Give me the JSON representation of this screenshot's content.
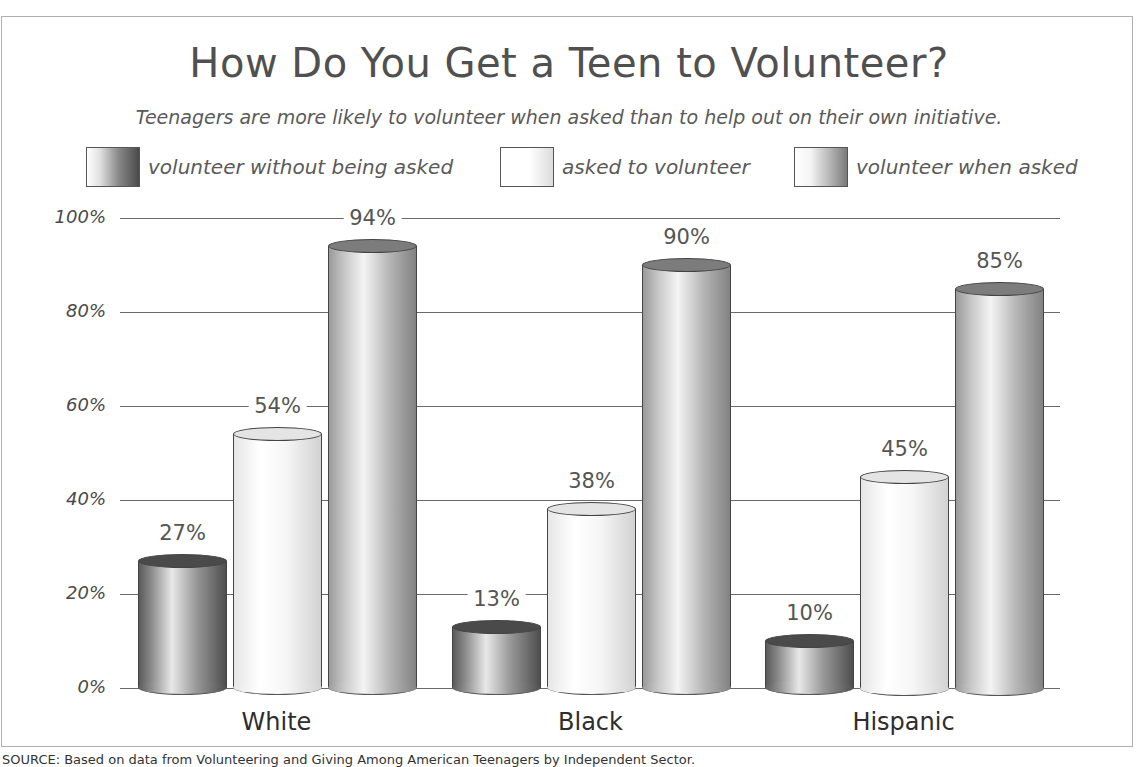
{
  "chart_data": {
    "type": "bar",
    "title": "How Do You Get a Teen to Volunteer?",
    "subtitle": "Teenagers are more likely to volunteer when asked than to help out on their own initiative.",
    "categories": [
      "White",
      "Black",
      "Hispanic"
    ],
    "series": [
      {
        "name": "volunteer without being asked",
        "values": [
          27,
          13,
          10
        ],
        "labels": [
          "27%",
          "13%",
          "10%"
        ],
        "color": "#4a4a4a"
      },
      {
        "name": "asked to volunteer",
        "values": [
          54,
          38,
          45
        ],
        "labels": [
          "54%",
          "38%",
          "45%"
        ],
        "color": "#e8e8e8"
      },
      {
        "name": "volunteer when asked",
        "values": [
          94,
          90,
          85
        ],
        "labels": [
          "94%",
          "90%",
          "85%"
        ],
        "color": "#9a9a9a"
      }
    ],
    "xlabel": "",
    "ylabel": "",
    "ylim": [
      0,
      100
    ],
    "yticks": [
      "0%",
      "20%",
      "40%",
      "60%",
      "80%",
      "100%"
    ],
    "grid": true,
    "legend_position": "top",
    "source": "SOURCE: Based on data from Volunteering and Giving Among American Teenagers by Independent Sector."
  }
}
